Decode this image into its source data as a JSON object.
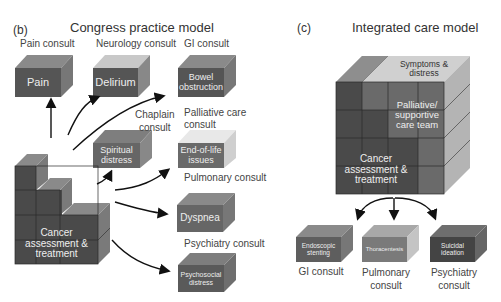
{
  "panel_b": {
    "letter": "(b)",
    "title": "Congress practice model",
    "consults": {
      "pain": {
        "label": "Pain consult",
        "box": "Pain"
      },
      "neurology": {
        "label": "Neurology consult",
        "box": "Delirium"
      },
      "gi": {
        "label": "GI consult",
        "box_line1": "Bowel",
        "box_line2": "obstruction"
      },
      "chaplain": {
        "label_line1": "Chaplain",
        "label_line2": "consult",
        "box_line1": "Spiritual",
        "box_line2": "distress"
      },
      "palliative": {
        "label_line1": "Palliative care",
        "label_line2": "consult",
        "box_line1": "End-of-life",
        "box_line2": "issues"
      },
      "pulmonary": {
        "label": "Pulmonary consult",
        "box": "Dyspnea"
      },
      "psychiatry": {
        "label": "Psychiatry consult",
        "box_line1": "Psychosocial",
        "box_line2": "distress"
      }
    },
    "core": {
      "line1": "Cancer",
      "line2": "assessment &",
      "line3": "treatment"
    }
  },
  "panel_c": {
    "letter": "(c)",
    "title": "Integrated care model",
    "top": {
      "line1": "Symptoms &",
      "line2": "distress"
    },
    "team": {
      "line1": "Palliative/",
      "line2": "supportive",
      "line3": "care team"
    },
    "core": {
      "line1": "Cancer",
      "line2": "assessment &",
      "line3": "treatment"
    },
    "consults": [
      {
        "box_line1": "Endoscopic",
        "box_line2": "stenting",
        "label_line1": "GI consult",
        "label_line2": ""
      },
      {
        "box_line1": "Thoracentesis",
        "box_line2": "",
        "label_line1": "Pulmonary",
        "label_line2": "consult"
      },
      {
        "box_line1": "Suicidal",
        "box_line2": "ideation",
        "label_line1": "Psychiatry",
        "label_line2": "consult"
      }
    ]
  },
  "colors": {
    "dark": "#4a4a4a",
    "mid": "#6e6e6e",
    "light": "#a8a8a8",
    "pale": "#d6d6d6"
  }
}
